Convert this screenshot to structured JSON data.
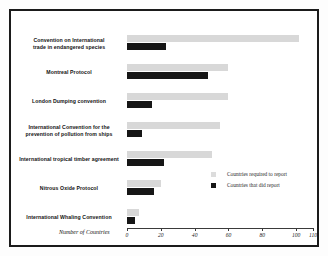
{
  "chart_data": {
    "type": "bar",
    "orientation": "horizontal",
    "title": "",
    "xlabel": "Number of Countries",
    "ylabel": "",
    "xlim": [
      0,
      110
    ],
    "xticks": [
      0,
      20,
      40,
      60,
      80,
      100,
      110
    ],
    "xtick_labels": [
      "0",
      "20",
      "40",
      "60",
      "80",
      "100",
      "110"
    ],
    "grid": false,
    "legend_position": "middle-right",
    "categories": [
      "Convention on International trade in endangered species",
      "Montreal Protocol",
      "London Dumping convention",
      "International Convention for the prevention of pollution from ships",
      "International tropical timber agreement",
      "Nitrous Oxide Protocol",
      "International Whaling Convention"
    ],
    "series": [
      {
        "name": "Countries required to report",
        "color": "#d8d8d8",
        "values": [
          102,
          60,
          60,
          55,
          50,
          20,
          7
        ]
      },
      {
        "name": "Countries that did report",
        "color": "#161616",
        "values": [
          23,
          48,
          15,
          9,
          22,
          16,
          5
        ]
      }
    ]
  },
  "chart": {
    "axis_title": "Number of Countries",
    "rows": [
      {
        "label_line1": "Convention on International",
        "label_line2": "trade in endangered species",
        "required": 102,
        "did": 23
      },
      {
        "label_line1": "Montreal Protocol",
        "label_line2": "",
        "required": 60,
        "did": 48
      },
      {
        "label_line1": "London Dumping convention",
        "label_line2": "",
        "required": 60,
        "did": 15
      },
      {
        "label_line1": "International Convention for the",
        "label_line2": "prevention of pollution from ships",
        "required": 55,
        "did": 9
      },
      {
        "label_line1": "International tropical timber agreement",
        "label_line2": "",
        "required": 50,
        "did": 22
      },
      {
        "label_line1": "Nitrous Oxide Protocol",
        "label_line2": "",
        "required": 20,
        "did": 16
      },
      {
        "label_line1": "International Whaling Convention",
        "label_line2": "",
        "required": 7,
        "did": 5
      }
    ],
    "ticks": [
      {
        "value": 0,
        "label": "0"
      },
      {
        "value": 20,
        "label": "20"
      },
      {
        "value": 40,
        "label": "40"
      },
      {
        "value": 60,
        "label": "60"
      },
      {
        "value": 80,
        "label": "80"
      },
      {
        "value": 100,
        "label": "100"
      },
      {
        "value": 110,
        "label": "110"
      }
    ],
    "legend": [
      {
        "label": "Countries required to report",
        "swatch": "required"
      },
      {
        "label": "Countries that did report",
        "swatch": "did"
      }
    ]
  }
}
